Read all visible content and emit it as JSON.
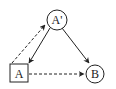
{
  "diagram": {
    "type": "causal-graph",
    "nodes": [
      {
        "id": "A_prime",
        "label": "A'",
        "shape": "circle"
      },
      {
        "id": "A",
        "label": "A",
        "shape": "square"
      },
      {
        "id": "B",
        "label": "B",
        "shape": "circle"
      }
    ],
    "edges": [
      {
        "from": "A_prime",
        "to": "A",
        "style": "solid"
      },
      {
        "from": "A_prime",
        "to": "B",
        "style": "solid"
      },
      {
        "from": "A",
        "to": "A_prime",
        "style": "dashed"
      },
      {
        "from": "A",
        "to": "B",
        "style": "dashed"
      }
    ],
    "colors": {
      "stroke": "#222222",
      "background": "#ffffff"
    }
  }
}
